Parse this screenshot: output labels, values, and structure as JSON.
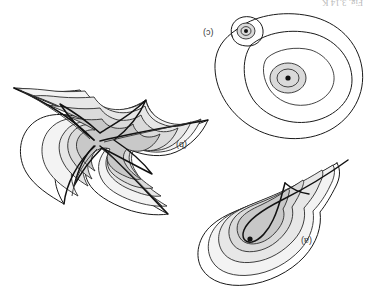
{
  "figure": {
    "title_fragment": "Fig. 3.14  K",
    "orientation_note": "180",
    "background_color": "#ffffff",
    "stroke_color": "#1a1a1a",
    "panels": [
      {
        "id": "a",
        "label": "(a)",
        "name": "teardrop-contour-panel",
        "description": "nested teardrop level curves around a single extremum with a cusped separatrix",
        "critical_points": 1
      },
      {
        "id": "b",
        "label": "(b)",
        "name": "astroid-contour-panel",
        "description": "four-pointed astroid level curves with a central saddle point and four cusps",
        "critical_points": 1
      },
      {
        "id": "c",
        "label": "(c)",
        "name": "two-center-contour-panel",
        "description": "two nested circular contour families, a large one and a small one, joined by an outer oval",
        "critical_points": 2
      }
    ],
    "shading": {
      "level_1": "#f2f2f2",
      "level_2": "#e6e6e6",
      "level_3": "#d9d9d9",
      "level_4": "#c9c9c9"
    }
  }
}
